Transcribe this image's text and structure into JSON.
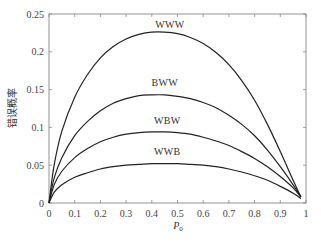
{
  "chart_data": {
    "type": "line",
    "title": "",
    "xlabel": "P0",
    "xlabel_main": "P",
    "xlabel_sub": "0",
    "ylabel": "错误概率",
    "xlim": [
      0,
      1
    ],
    "ylim": [
      0,
      0.25
    ],
    "grid": false,
    "legend": "inline curve labels",
    "x_ticks": [
      0,
      0.1,
      0.2,
      0.3,
      0.4,
      0.5,
      0.6,
      0.7,
      0.8,
      0.9,
      1
    ],
    "x_tick_labels": [
      "0",
      "0.1",
      "0.2",
      "0.3",
      "0.4",
      "0.5",
      "0.6",
      "0.7",
      "0.8",
      "0.9",
      "1"
    ],
    "y_ticks": [
      0,
      0.05,
      0.1,
      0.15,
      0.2,
      0.25
    ],
    "y_tick_labels": [
      "0",
      "0.05",
      "0.1",
      "0.15",
      "0.2",
      "0.25"
    ],
    "x": [
      0,
      0.02,
      0.05,
      0.1,
      0.15,
      0.2,
      0.25,
      0.3,
      0.35,
      0.4,
      0.45,
      0.5,
      0.55,
      0.6,
      0.65,
      0.7,
      0.75,
      0.8,
      0.85,
      0.9,
      0.95,
      0.98
    ],
    "series": [
      {
        "name": "WWW",
        "values": [
          0,
          0.05,
          0.095,
          0.14,
          0.17,
          0.192,
          0.207,
          0.217,
          0.223,
          0.226,
          0.226,
          0.224,
          0.219,
          0.211,
          0.199,
          0.183,
          0.162,
          0.136,
          0.104,
          0.068,
          0.03,
          0.008
        ]
      },
      {
        "name": "BWW",
        "values": [
          0,
          0.033,
          0.06,
          0.089,
          0.108,
          0.122,
          0.132,
          0.138,
          0.142,
          0.143,
          0.143,
          0.141,
          0.138,
          0.133,
          0.126,
          0.116,
          0.104,
          0.089,
          0.07,
          0.048,
          0.024,
          0.008
        ]
      },
      {
        "name": "WBW",
        "values": [
          0,
          0.024,
          0.042,
          0.06,
          0.072,
          0.081,
          0.087,
          0.091,
          0.093,
          0.094,
          0.094,
          0.093,
          0.091,
          0.087,
          0.082,
          0.076,
          0.068,
          0.059,
          0.048,
          0.035,
          0.02,
          0.008
        ]
      },
      {
        "name": "WWB",
        "values": [
          0,
          0.014,
          0.024,
          0.034,
          0.04,
          0.045,
          0.048,
          0.05,
          0.051,
          0.052,
          0.052,
          0.052,
          0.051,
          0.05,
          0.048,
          0.045,
          0.041,
          0.036,
          0.03,
          0.022,
          0.013,
          0.006
        ]
      }
    ],
    "annotations": [
      {
        "text": "WWW",
        "x": 0.47,
        "y": 0.232
      },
      {
        "text": "BWW",
        "x": 0.45,
        "y": 0.155
      },
      {
        "text": "WBW",
        "x": 0.46,
        "y": 0.105
      },
      {
        "text": "WWB",
        "x": 0.46,
        "y": 0.064
      }
    ]
  },
  "colors": {
    "axis": "#888888",
    "curve": "#222222",
    "text": "#333333"
  }
}
